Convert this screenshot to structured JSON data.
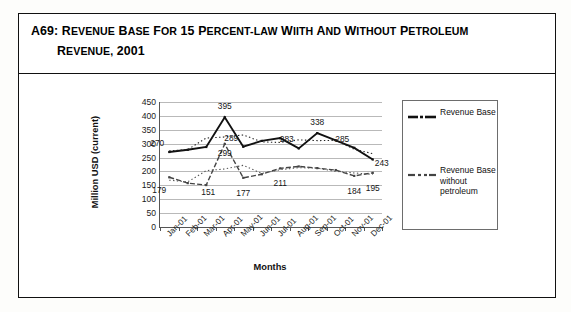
{
  "caption": {
    "number": "A69:",
    "line1_parts": [
      "Revenue",
      "Base",
      "for",
      "15",
      "percent-",
      "Law",
      "wiith",
      "and",
      "without",
      "Petroleum"
    ],
    "line1": "Revenue Base for 15 percent-Law wiith and without Petroleum",
    "line2": "Revenue, 2001"
  },
  "chart_data": {
    "type": "line",
    "title": "",
    "xlabel": "Months",
    "ylabel": "Million USD (current)",
    "categories": [
      "Jan-01",
      "Feb-01",
      "Mar-01",
      "Apr-01",
      "May-01",
      "Jun-01",
      "Jul-01",
      "Aug-01",
      "Sep-01",
      "Oct-01",
      "Nov-01",
      "Dec-01"
    ],
    "ylim": [
      0,
      450
    ],
    "yticks": [
      0,
      50,
      100,
      150,
      200,
      250,
      300,
      350,
      400,
      450
    ],
    "grid": true,
    "legend_position": "right",
    "series": [
      {
        "name": "Revenue Base",
        "style": "solid-with-markers",
        "color": "#111111",
        "values": [
          270,
          278,
          288,
          395,
          289,
          310,
          320,
          283,
          338,
          312,
          285,
          243
        ],
        "labels": [
          {
            "category": "Jan-01",
            "value": 270,
            "text": "270"
          },
          {
            "category": "Apr-01",
            "value": 395,
            "text": "395"
          },
          {
            "category": "May-01",
            "value": 289,
            "text": "289"
          },
          {
            "category": "Aug-01",
            "value": 283,
            "text": "283"
          },
          {
            "category": "Sep-01",
            "value": 338,
            "text": "338"
          },
          {
            "category": "Nov-01",
            "value": 285,
            "text": "285"
          },
          {
            "category": "Dec-01",
            "value": 243,
            "text": "243"
          }
        ],
        "trend_style": "dotted"
      },
      {
        "name": "Revenue Base without petroleum",
        "style": "dashed-with-markers",
        "color": "#444444",
        "values": [
          179,
          158,
          151,
          299,
          177,
          190,
          211,
          218,
          212,
          205,
          184,
          195
        ],
        "labels": [
          {
            "category": "Jan-01",
            "value": 179,
            "text": "179"
          },
          {
            "category": "Mar-01",
            "value": 151,
            "text": "151"
          },
          {
            "category": "Apr-01",
            "value": 299,
            "text": "299"
          },
          {
            "category": "May-01",
            "value": 177,
            "text": "177"
          },
          {
            "category": "Jul-01",
            "value": 211,
            "text": "211"
          },
          {
            "category": "Nov-01",
            "value": 184,
            "text": "184"
          },
          {
            "category": "Dec-01",
            "value": 195,
            "text": "195"
          }
        ],
        "trend_style": "dotted"
      }
    ]
  },
  "legend": {
    "entries": [
      {
        "label": "Revenue Base",
        "swatch": "solid-line-marker"
      },
      {
        "label": "Revenue Base without petroleum",
        "swatch": "dashed-line-marker"
      }
    ]
  }
}
